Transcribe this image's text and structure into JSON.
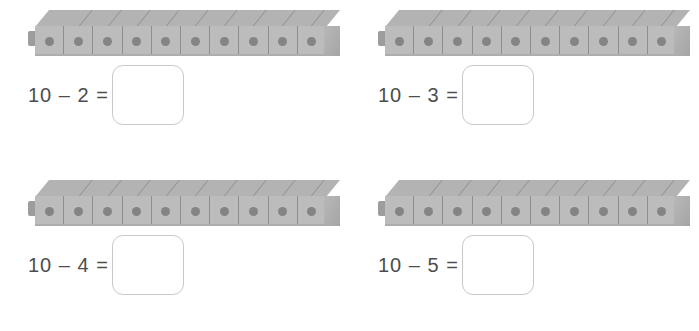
{
  "worksheet": {
    "type": "math-worksheet",
    "topic": "subtraction-from-ten-with-cube-bars",
    "background_color": "#ffffff",
    "colors": {
      "cube_top_face": "#b3b3b3",
      "cube_front_face": "#bcbcbc",
      "cube_dot": "#848484",
      "cube_seam": "#8f8f8f",
      "cube_nub": "#9d9d9d",
      "cube_end_cap": "#aeaeae",
      "equation_text": "#4d4d4d",
      "answer_box_border": "#c9c9c9",
      "answer_box_fill": "#ffffff"
    },
    "problems": [
      {
        "id": "problem-1",
        "equation": "10 – 2 =",
        "minuend": 10,
        "subtrahend": 2,
        "answer": "",
        "cube_count": 10,
        "cube_bar_label": "ten-cube-bar"
      },
      {
        "id": "problem-2",
        "equation": "10 – 3 =",
        "minuend": 10,
        "subtrahend": 3,
        "answer": "",
        "cube_count": 10,
        "cube_bar_label": "ten-cube-bar"
      },
      {
        "id": "problem-3",
        "equation": "10 – 4 =",
        "minuend": 10,
        "subtrahend": 4,
        "answer": "",
        "cube_count": 10,
        "cube_bar_label": "ten-cube-bar"
      },
      {
        "id": "problem-4",
        "equation": "10 – 5 =",
        "minuend": 10,
        "subtrahend": 5,
        "answer": "",
        "cube_count": 10,
        "cube_bar_label": "ten-cube-bar"
      }
    ]
  }
}
